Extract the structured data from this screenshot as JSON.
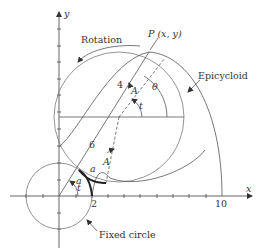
{
  "figure": {
    "axes": {
      "x_label": "x",
      "y_label": "y"
    },
    "tick_labels": {
      "x_2": "2",
      "x_10": "10"
    },
    "labels": {
      "rotation": "Rotation",
      "point": "P (x, y)",
      "epicycloid": "Epicycloid",
      "fixed_circle": "Fixed circle",
      "theta": "θ",
      "t_upper": "t",
      "t_lower": "t",
      "A_upper": "A",
      "A_lower": "A",
      "a_arc_fixed": "a",
      "a_arc_rolling": "a",
      "len_4": "4",
      "len_6": "6"
    },
    "geometry": {
      "fixed_circle_radius": 2,
      "rolling_circle_radius": 4,
      "center_distance": 6,
      "epicycloid_cusp_x": 10
    }
  }
}
